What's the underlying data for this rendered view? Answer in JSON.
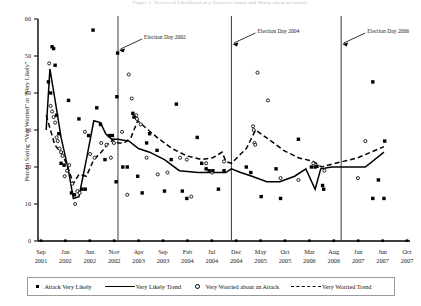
{
  "figure": {
    "top_caption": "Figure 1.  Perceived Likelihood of a Terrorist Attack and Worry about an Attack"
  },
  "axes": {
    "y_label": "Percent Saying \"Very Worried\" or \"Very Likely\"",
    "y_ticks": [
      0,
      10,
      20,
      30,
      40,
      50,
      60
    ],
    "x_tick_labels": [
      {
        "month": "Sep",
        "year": "2001"
      },
      {
        "month": "Jan",
        "year": "2002"
      },
      {
        "month": "Jun",
        "year": "2002"
      },
      {
        "month": "Nov",
        "year": "2002"
      },
      {
        "month": "Apr",
        "year": "2003"
      },
      {
        "month": "Sep",
        "year": "2003"
      },
      {
        "month": "Feb",
        "year": "2004"
      },
      {
        "month": "Jul",
        "year": "2004"
      },
      {
        "month": "Dec",
        "year": "2004"
      },
      {
        "month": "May",
        "year": "2005"
      },
      {
        "month": "Oct",
        "year": "2005"
      },
      {
        "month": "Mar",
        "year": "2006"
      },
      {
        "month": "Aug",
        "year": "2006"
      },
      {
        "month": "Jan",
        "year": "2007"
      },
      {
        "month": "Jun",
        "year": "2007"
      },
      {
        "month": "Oct",
        "year": "2007"
      }
    ]
  },
  "annotations": [
    {
      "name": "election-day-2002",
      "label": "Election Day 2002",
      "x_pct": 0.215
    },
    {
      "name": "election-day-2004",
      "label": "Election Day 2004",
      "x_pct": 0.52
    },
    {
      "name": "election-day-2006",
      "label": "Election Day 2006",
      "x_pct": 0.815
    }
  ],
  "legend": {
    "items": [
      {
        "name": "attack-very-likely",
        "label": "Attack Very Likely",
        "marker": "filled-square",
        "color": "#000000"
      },
      {
        "name": "very-likely-trend",
        "label": "Very Likely Trend",
        "marker": "solid-line",
        "color": "#000000"
      },
      {
        "name": "very-worried-about-an-attack",
        "label": "Very Worried about an Attack",
        "marker": "open-circle",
        "color": "#000000"
      },
      {
        "name": "very-worried-trend",
        "label": "Very Worried Trend",
        "marker": "dashed-line",
        "color": "#000000"
      }
    ]
  },
  "chart_data": {
    "type": "scatter",
    "title": "Perceived Likelihood of a Terrorist Attack and Worry about an Attack",
    "xlabel": "",
    "ylabel": "Percent Saying \"Very Worried\" or \"Very Likely\"",
    "ylim": [
      0,
      60
    ],
    "xlim": [
      0,
      1
    ],
    "grid": false,
    "legend_position": "bottom",
    "vertical_rules": [
      {
        "label": "Election Day 2002",
        "x_pct": 0.215
      },
      {
        "label": "Election Day 2004",
        "x_pct": 0.52
      },
      {
        "label": "Election Day 2006",
        "x_pct": 0.815
      }
    ],
    "series": [
      {
        "name": "Attack Very Likely",
        "type": "scatter",
        "marker": "filled-square",
        "points": [
          {
            "x_pct": 0.028,
            "y": 43.0
          },
          {
            "x_pct": 0.034,
            "y": 40.0
          },
          {
            "x_pct": 0.038,
            "y": 52.5
          },
          {
            "x_pct": 0.042,
            "y": 52.0
          },
          {
            "x_pct": 0.046,
            "y": 47.5
          },
          {
            "x_pct": 0.05,
            "y": 34.0
          },
          {
            "x_pct": 0.056,
            "y": 29.0
          },
          {
            "x_pct": 0.062,
            "y": 21.0
          },
          {
            "x_pct": 0.07,
            "y": 20.5
          },
          {
            "x_pct": 0.082,
            "y": 38.0
          },
          {
            "x_pct": 0.09,
            "y": 13.0
          },
          {
            "x_pct": 0.098,
            "y": 12.5
          },
          {
            "x_pct": 0.11,
            "y": 33.0
          },
          {
            "x_pct": 0.118,
            "y": 14.0
          },
          {
            "x_pct": 0.127,
            "y": 14.0
          },
          {
            "x_pct": 0.136,
            "y": 28.5
          },
          {
            "x_pct": 0.148,
            "y": 57.0
          },
          {
            "x_pct": 0.158,
            "y": 36.0
          },
          {
            "x_pct": 0.168,
            "y": 31.5
          },
          {
            "x_pct": 0.18,
            "y": 22.0
          },
          {
            "x_pct": 0.192,
            "y": 28.5
          },
          {
            "x_pct": 0.2,
            "y": 28.5
          },
          {
            "x_pct": 0.21,
            "y": 16.0
          },
          {
            "x_pct": 0.212,
            "y": 39.0
          },
          {
            "x_pct": 0.214,
            "y": 50.8
          },
          {
            "x_pct": 0.228,
            "y": 20.0
          },
          {
            "x_pct": 0.24,
            "y": 20.0
          },
          {
            "x_pct": 0.255,
            "y": 34.5
          },
          {
            "x_pct": 0.258,
            "y": 33.5
          },
          {
            "x_pct": 0.268,
            "y": 17.5
          },
          {
            "x_pct": 0.28,
            "y": 13.0
          },
          {
            "x_pct": 0.292,
            "y": 26.5
          },
          {
            "x_pct": 0.3,
            "y": 29.0
          },
          {
            "x_pct": 0.32,
            "y": 24.5
          },
          {
            "x_pct": 0.34,
            "y": 13.5
          },
          {
            "x_pct": 0.358,
            "y": 22.0
          },
          {
            "x_pct": 0.372,
            "y": 37.0
          },
          {
            "x_pct": 0.388,
            "y": 13.5
          },
          {
            "x_pct": 0.4,
            "y": 11.5
          },
          {
            "x_pct": 0.428,
            "y": 28.0
          },
          {
            "x_pct": 0.44,
            "y": 21.0
          },
          {
            "x_pct": 0.452,
            "y": 19.5
          },
          {
            "x_pct": 0.46,
            "y": 19.0
          },
          {
            "x_pct": 0.47,
            "y": 19.0
          },
          {
            "x_pct": 0.485,
            "y": 14.0
          },
          {
            "x_pct": 0.5,
            "y": 19.0
          },
          {
            "x_pct": 0.56,
            "y": 20.0
          },
          {
            "x_pct": 0.572,
            "y": 18.5
          },
          {
            "x_pct": 0.6,
            "y": 12.0
          },
          {
            "x_pct": 0.64,
            "y": 19.5
          },
          {
            "x_pct": 0.652,
            "y": 11.5
          },
          {
            "x_pct": 0.7,
            "y": 27.5
          },
          {
            "x_pct": 0.735,
            "y": 20.0
          },
          {
            "x_pct": 0.745,
            "y": 20.0
          },
          {
            "x_pct": 0.75,
            "y": 20.2
          },
          {
            "x_pct": 0.765,
            "y": 15.0
          },
          {
            "x_pct": 0.768,
            "y": 14.0
          },
          {
            "x_pct": 0.9,
            "y": 43.0
          },
          {
            "x_pct": 0.932,
            "y": 27.0
          },
          {
            "x_pct": 0.915,
            "y": 16.5
          },
          {
            "x_pct": 0.9,
            "y": 11.5
          },
          {
            "x_pct": 0.93,
            "y": 11.5
          }
        ]
      },
      {
        "name": "Very Worried about an Attack",
        "type": "scatter",
        "marker": "open-circle",
        "points": [
          {
            "x_pct": 0.03,
            "y": 48.0
          },
          {
            "x_pct": 0.034,
            "y": 36.5
          },
          {
            "x_pct": 0.038,
            "y": 35.0
          },
          {
            "x_pct": 0.042,
            "y": 33.5
          },
          {
            "x_pct": 0.046,
            "y": 32.0
          },
          {
            "x_pct": 0.05,
            "y": 28.0
          },
          {
            "x_pct": 0.053,
            "y": 27.0
          },
          {
            "x_pct": 0.058,
            "y": 25.0
          },
          {
            "x_pct": 0.062,
            "y": 24.0
          },
          {
            "x_pct": 0.066,
            "y": 23.0
          },
          {
            "x_pct": 0.072,
            "y": 17.5
          },
          {
            "x_pct": 0.078,
            "y": 19.0
          },
          {
            "x_pct": 0.084,
            "y": 20.5
          },
          {
            "x_pct": 0.092,
            "y": 15.5
          },
          {
            "x_pct": 0.1,
            "y": 10.0
          },
          {
            "x_pct": 0.106,
            "y": 13.5
          },
          {
            "x_pct": 0.112,
            "y": 13.0
          },
          {
            "x_pct": 0.126,
            "y": 29.5
          },
          {
            "x_pct": 0.14,
            "y": 23.5
          },
          {
            "x_pct": 0.152,
            "y": 22.5
          },
          {
            "x_pct": 0.17,
            "y": 26.5
          },
          {
            "x_pct": 0.184,
            "y": 26.0
          },
          {
            "x_pct": 0.196,
            "y": 22.5
          },
          {
            "x_pct": 0.204,
            "y": 26.5
          },
          {
            "x_pct": 0.226,
            "y": 29.5
          },
          {
            "x_pct": 0.24,
            "y": 12.5
          },
          {
            "x_pct": 0.244,
            "y": 45.0
          },
          {
            "x_pct": 0.252,
            "y": 38.5
          },
          {
            "x_pct": 0.264,
            "y": 34.0
          },
          {
            "x_pct": 0.266,
            "y": 33.0
          },
          {
            "x_pct": 0.276,
            "y": 31.5
          },
          {
            "x_pct": 0.292,
            "y": 22.5
          },
          {
            "x_pct": 0.322,
            "y": 18.0
          },
          {
            "x_pct": 0.348,
            "y": 18.5
          },
          {
            "x_pct": 0.382,
            "y": 22.5
          },
          {
            "x_pct": 0.4,
            "y": 22.0
          },
          {
            "x_pct": 0.412,
            "y": 12.0
          },
          {
            "x_pct": 0.452,
            "y": 21.0
          },
          {
            "x_pct": 0.468,
            "y": 18.5
          },
          {
            "x_pct": 0.5,
            "y": 21.5
          },
          {
            "x_pct": 0.59,
            "y": 45.5
          },
          {
            "x_pct": 0.618,
            "y": 38.0
          },
          {
            "x_pct": 0.578,
            "y": 31.0
          },
          {
            "x_pct": 0.58,
            "y": 30.0
          },
          {
            "x_pct": 0.582,
            "y": 26.5
          },
          {
            "x_pct": 0.584,
            "y": 26.0
          },
          {
            "x_pct": 0.652,
            "y": 17.0
          },
          {
            "x_pct": 0.7,
            "y": 16.5
          },
          {
            "x_pct": 0.74,
            "y": 21.0
          },
          {
            "x_pct": 0.77,
            "y": 19.0
          },
          {
            "x_pct": 0.88,
            "y": 27.0
          },
          {
            "x_pct": 0.86,
            "y": 17.0
          }
        ]
      },
      {
        "name": "Very Likely Trend",
        "type": "line",
        "style": "solid",
        "points": [
          {
            "x_pct": 0.022,
            "y": 30.0
          },
          {
            "x_pct": 0.032,
            "y": 46.5
          },
          {
            "x_pct": 0.046,
            "y": 38.0
          },
          {
            "x_pct": 0.062,
            "y": 28.0
          },
          {
            "x_pct": 0.082,
            "y": 19.0
          },
          {
            "x_pct": 0.095,
            "y": 11.5
          },
          {
            "x_pct": 0.11,
            "y": 12.0
          },
          {
            "x_pct": 0.13,
            "y": 22.0
          },
          {
            "x_pct": 0.15,
            "y": 32.5
          },
          {
            "x_pct": 0.168,
            "y": 32.0
          },
          {
            "x_pct": 0.182,
            "y": 29.0
          },
          {
            "x_pct": 0.198,
            "y": 27.5
          },
          {
            "x_pct": 0.215,
            "y": 27.5
          },
          {
            "x_pct": 0.245,
            "y": 27.0
          },
          {
            "x_pct": 0.27,
            "y": 25.0
          },
          {
            "x_pct": 0.3,
            "y": 24.0
          },
          {
            "x_pct": 0.34,
            "y": 22.0
          },
          {
            "x_pct": 0.38,
            "y": 19.0
          },
          {
            "x_pct": 0.43,
            "y": 18.5
          },
          {
            "x_pct": 0.47,
            "y": 18.5
          },
          {
            "x_pct": 0.505,
            "y": 18.5
          },
          {
            "x_pct": 0.52,
            "y": 19.5
          },
          {
            "x_pct": 0.545,
            "y": 18.5
          },
          {
            "x_pct": 0.575,
            "y": 17.5
          },
          {
            "x_pct": 0.615,
            "y": 16.0
          },
          {
            "x_pct": 0.65,
            "y": 16.0
          },
          {
            "x_pct": 0.69,
            "y": 17.5
          },
          {
            "x_pct": 0.72,
            "y": 19.5
          },
          {
            "x_pct": 0.745,
            "y": 14.0
          },
          {
            "x_pct": 0.76,
            "y": 19.5
          },
          {
            "x_pct": 0.79,
            "y": 20.0
          },
          {
            "x_pct": 0.83,
            "y": 20.0
          },
          {
            "x_pct": 0.88,
            "y": 20.0
          },
          {
            "x_pct": 0.93,
            "y": 24.0
          }
        ]
      },
      {
        "name": "Very Worried Trend",
        "type": "line",
        "style": "dashed",
        "points": [
          {
            "x_pct": 0.022,
            "y": 34.0
          },
          {
            "x_pct": 0.045,
            "y": 26.0
          },
          {
            "x_pct": 0.065,
            "y": 23.5
          },
          {
            "x_pct": 0.08,
            "y": 20.0
          },
          {
            "x_pct": 0.095,
            "y": 15.5
          },
          {
            "x_pct": 0.11,
            "y": 18.0
          },
          {
            "x_pct": 0.13,
            "y": 17.5
          },
          {
            "x_pct": 0.15,
            "y": 22.0
          },
          {
            "x_pct": 0.17,
            "y": 24.0
          },
          {
            "x_pct": 0.19,
            "y": 26.5
          },
          {
            "x_pct": 0.205,
            "y": 27.5
          },
          {
            "x_pct": 0.215,
            "y": 26.5
          },
          {
            "x_pct": 0.232,
            "y": 26.5
          },
          {
            "x_pct": 0.25,
            "y": 28.0
          },
          {
            "x_pct": 0.268,
            "y": 32.5
          },
          {
            "x_pct": 0.285,
            "y": 31.0
          },
          {
            "x_pct": 0.32,
            "y": 28.0
          },
          {
            "x_pct": 0.36,
            "y": 25.0
          },
          {
            "x_pct": 0.4,
            "y": 23.0
          },
          {
            "x_pct": 0.44,
            "y": 22.0
          },
          {
            "x_pct": 0.47,
            "y": 22.5
          },
          {
            "x_pct": 0.495,
            "y": 24.0
          },
          {
            "x_pct": 0.505,
            "y": 21.5
          },
          {
            "x_pct": 0.52,
            "y": 21.0
          },
          {
            "x_pct": 0.56,
            "y": 25.0
          },
          {
            "x_pct": 0.585,
            "y": 30.0
          },
          {
            "x_pct": 0.62,
            "y": 27.5
          },
          {
            "x_pct": 0.66,
            "y": 24.5
          },
          {
            "x_pct": 0.7,
            "y": 22.5
          },
          {
            "x_pct": 0.74,
            "y": 21.5
          },
          {
            "x_pct": 0.762,
            "y": 20.0
          },
          {
            "x_pct": 0.8,
            "y": 21.0
          },
          {
            "x_pct": 0.86,
            "y": 22.5
          },
          {
            "x_pct": 0.93,
            "y": 25.5
          }
        ]
      }
    ]
  }
}
